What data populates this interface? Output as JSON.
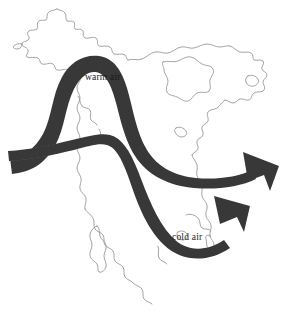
{
  "figure": {
    "background_color": "#ffffff"
  },
  "map": {
    "name": "north-america-outline",
    "stroke_color": "#8d8d8d",
    "regions": [
      "Alaska",
      "Western Canada",
      "Hudson Bay",
      "Eastern Canada",
      "Newfoundland",
      "United States East Coast",
      "Baja California",
      "Western Mexico"
    ]
  },
  "flows": {
    "warm": {
      "label": "warm air",
      "color": "#3a3a3a",
      "direction": "northward-arch-then-east",
      "label_x": 85,
      "label_y": 80
    },
    "cold": {
      "label": "cold air",
      "color": "#3a3a3a",
      "direction": "southward-dip-then-northeast",
      "label_x": 172,
      "label_y": 240
    }
  }
}
